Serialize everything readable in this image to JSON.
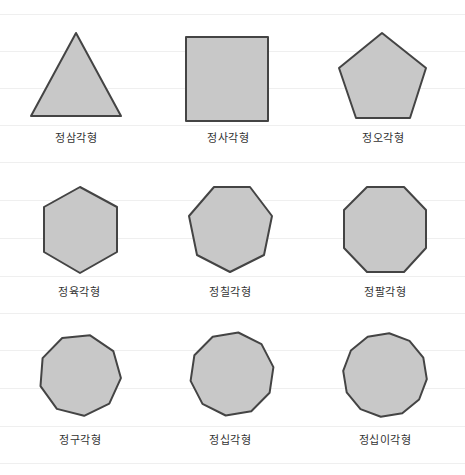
{
  "style": {
    "fill": "#c8c8c8",
    "stroke": "#444444",
    "label_color": "#333333"
  },
  "shapes": [
    {
      "name": "equilateral-triangle",
      "label": "정삼각형",
      "sides": 3
    },
    {
      "name": "square",
      "label": "정사각형",
      "sides": 4
    },
    {
      "name": "regular-pentagon",
      "label": "정오각형",
      "sides": 5
    },
    {
      "name": "regular-hexagon",
      "label": "정육각형",
      "sides": 6
    },
    {
      "name": "regular-heptagon",
      "label": "정칠각형",
      "sides": 7
    },
    {
      "name": "regular-octagon",
      "label": "정팔각형",
      "sides": 8
    },
    {
      "name": "regular-nonagon",
      "label": "정구각형",
      "sides": 9
    },
    {
      "name": "regular-decagon",
      "label": "정십각형",
      "sides": 10
    },
    {
      "name": "regular-dodecagon",
      "label": "정십이각형",
      "sides": 12
    }
  ]
}
